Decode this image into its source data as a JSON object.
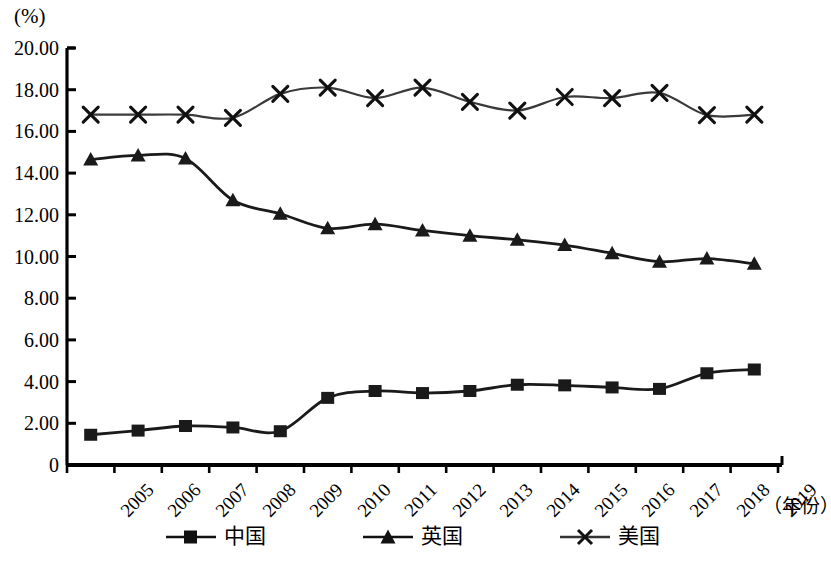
{
  "chart_data": {
    "type": "line",
    "title": "",
    "unit_label": "(%)",
    "xlabel": "（年份）",
    "ylabel": "",
    "x": [
      "2005",
      "2006",
      "2007",
      "2008",
      "2009",
      "2010",
      "2011",
      "2012",
      "2013",
      "2014",
      "2015",
      "2016",
      "2017",
      "2018",
      "2019"
    ],
    "categories": [
      "2005",
      "2006",
      "2007",
      "2008",
      "2009",
      "2010",
      "2011",
      "2012",
      "2013",
      "2014",
      "2015",
      "2016",
      "2017",
      "2018",
      "2019"
    ],
    "ylim": [
      0,
      20
    ],
    "yticks": [
      0,
      2,
      4,
      6,
      8,
      10,
      12,
      14,
      16,
      18,
      20
    ],
    "ytick_labels": [
      "0",
      "2.00",
      "4.00",
      "6.00",
      "8.00",
      "10.00",
      "12.00",
      "14.00",
      "16.00",
      "18.00",
      "20.00"
    ],
    "grid": false,
    "legend_position": "bottom",
    "series": [
      {
        "name": "中国",
        "marker": "square",
        "color": "#1a1a1a",
        "values": [
          1.45,
          1.65,
          1.87,
          1.8,
          1.62,
          3.22,
          3.55,
          3.45,
          3.55,
          3.85,
          3.82,
          3.72,
          3.65,
          4.4,
          4.58
        ]
      },
      {
        "name": "英国",
        "marker": "triangle",
        "color": "#1a1a1a",
        "values": [
          14.65,
          14.85,
          14.7,
          12.7,
          12.05,
          11.35,
          11.55,
          11.25,
          11.0,
          10.8,
          10.55,
          10.15,
          9.75,
          9.9,
          9.65
        ]
      },
      {
        "name": "美国",
        "marker": "cross",
        "color": "#3a3a3a",
        "values": [
          16.8,
          16.8,
          16.8,
          16.65,
          17.8,
          18.1,
          17.6,
          18.1,
          17.42,
          17.0,
          17.65,
          17.6,
          17.85,
          16.78,
          16.8
        ]
      }
    ]
  },
  "legend": [
    {
      "label": "中国",
      "marker": "square"
    },
    {
      "label": "英国",
      "marker": "triangle"
    },
    {
      "label": "美国",
      "marker": "cross"
    }
  ]
}
